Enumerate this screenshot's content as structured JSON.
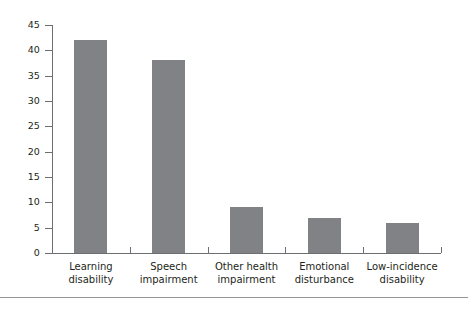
{
  "chart_data": {
    "type": "bar",
    "title": "",
    "subtitle": "",
    "xlabel": "",
    "ylabel": "",
    "categories": [
      "Learning disability",
      "Speech impairment",
      "Other health impairment",
      "Emotional disturbance",
      "Low-incidence disability"
    ],
    "category_lines": [
      [
        "Learning",
        "disability"
      ],
      [
        "Speech",
        "impairment"
      ],
      [
        "Other health",
        "impairment"
      ],
      [
        "Emotional",
        "disturbance"
      ],
      [
        "Low-incidence",
        "disability"
      ]
    ],
    "values": [
      42,
      38,
      9,
      7,
      6
    ],
    "ylim": [
      0,
      45
    ],
    "ytick_labels": [
      "0",
      "5",
      "10",
      "15",
      "20",
      "25",
      "30",
      "35",
      "40",
      "45"
    ],
    "ytick_values": [
      0,
      5,
      10,
      15,
      20,
      25,
      30,
      35,
      40,
      45
    ],
    "grid": false,
    "legend": "none",
    "bar_color": "#808285",
    "axis_color": "#6d6e71",
    "text_color": "#231f20",
    "background_color": "#ffffff",
    "rule_color": "#939598"
  }
}
